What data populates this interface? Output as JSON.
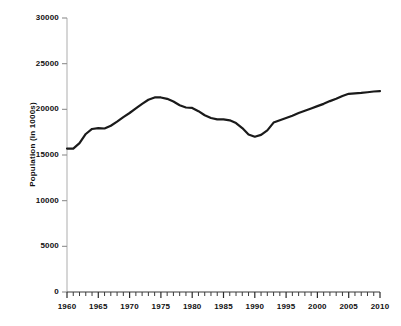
{
  "chart_data": {
    "type": "line",
    "title": "",
    "subtitle": "",
    "xlabel": "",
    "ylabel": "Population (in 1000s)",
    "xlim": [
      1960,
      2010
    ],
    "ylim": [
      0,
      30000
    ],
    "grid": false,
    "legend": null,
    "legend_position": "none",
    "y_ticks": [
      0,
      5000,
      10000,
      15000,
      20000,
      25000,
      30000
    ],
    "y_tick_labels": [
      "0",
      "5000",
      "10000",
      "15000",
      "20000",
      "25000",
      "30000"
    ],
    "x_ticks": [
      1960,
      1965,
      1970,
      1975,
      1980,
      1985,
      1990,
      1995,
      2000,
      2005,
      2010
    ],
    "x_tick_labels": [
      "1960",
      "1965",
      "1970",
      "1975",
      "1980",
      "1985",
      "1990",
      "1995",
      "2000",
      "2005",
      "2010"
    ],
    "x_minor_tick_interval": 1,
    "line_color": "#1a1a1a",
    "line_width": 2.2,
    "series": [
      {
        "name": "Population",
        "x": [
          1960,
          1961,
          1962,
          1963,
          1964,
          1965,
          1966,
          1967,
          1968,
          1969,
          1970,
          1971,
          1972,
          1973,
          1974,
          1975,
          1976,
          1977,
          1978,
          1979,
          1980,
          1981,
          1982,
          1983,
          1984,
          1985,
          1986,
          1987,
          1988,
          1989,
          1990,
          1991,
          1992,
          1993,
          1994,
          1995,
          1996,
          1997,
          1998,
          1999,
          2000,
          2001,
          2002,
          2003,
          2004,
          2005,
          2006,
          2007,
          2008,
          2009,
          2010
        ],
        "values": [
          15700,
          15700,
          16300,
          17300,
          17850,
          17950,
          17900,
          18200,
          18650,
          19150,
          19600,
          20100,
          20600,
          21050,
          21300,
          21300,
          21150,
          20850,
          20450,
          20200,
          20150,
          19800,
          19350,
          19050,
          18900,
          18900,
          18800,
          18500,
          17950,
          17250,
          17000,
          17200,
          17700,
          18550,
          18800,
          19050,
          19300,
          19600,
          19850,
          20100,
          20350,
          20600,
          20900,
          21150,
          21450,
          21700,
          21750,
          21800,
          21870,
          21950,
          22000
        ]
      }
    ]
  },
  "axes": {
    "y_axis_title": "Population (in 1000s)"
  }
}
